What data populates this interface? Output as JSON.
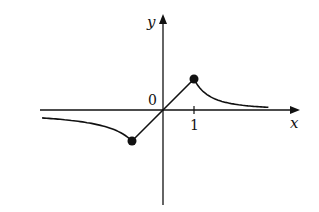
{
  "chart_data": {
    "type": "line",
    "title": "",
    "xlabel": "x",
    "ylabel": "y",
    "origin_label": "0",
    "x_ticks": [
      {
        "value": 1,
        "label": "1"
      }
    ],
    "grid": false,
    "legend": null,
    "series": [
      {
        "name": "f(x)",
        "description": "Odd function: approaches 0 from below as x→-∞, local min at x=-1 (y=-1), linear through origin, local max at x=1 (y=1), decays to 0 as x→+∞",
        "points": [
          [
            -4,
            -0.25
          ],
          [
            -3,
            -0.33
          ],
          [
            -2,
            -0.5
          ],
          [
            -1.5,
            -0.67
          ],
          [
            -1,
            -1
          ],
          [
            0,
            0
          ],
          [
            1,
            1
          ],
          [
            1.5,
            0.67
          ],
          [
            2,
            0.5
          ],
          [
            3,
            0.33
          ],
          [
            3.4,
            0.29
          ]
        ],
        "marked_points": [
          [
            -1,
            -1
          ],
          [
            1,
            1
          ]
        ]
      }
    ],
    "xlim": [
      -4,
      3.5
    ],
    "ylim": [
      -3,
      3
    ]
  }
}
